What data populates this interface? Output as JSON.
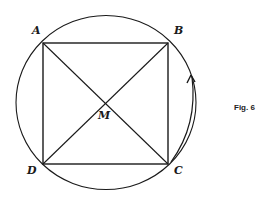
{
  "figure": {
    "caption": "Fig. 6",
    "points": {
      "A": "A",
      "B": "B",
      "C": "C",
      "D": "D",
      "M": "M"
    },
    "colors": {
      "stroke": "#1a1a1a",
      "background": "#ffffff"
    }
  }
}
